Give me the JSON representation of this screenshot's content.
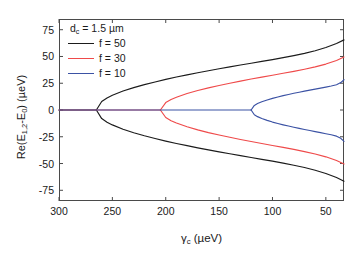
{
  "chart_data": {
    "type": "line",
    "title": "",
    "xlabel": "γ_c (μeV)",
    "ylabel": "Re(E_1,2 - E_0) (μeV)",
    "xlabel_parts": {
      "symbol": "γ",
      "sub": "c",
      "unit": "(μeV)"
    },
    "ylabel_parts": {
      "prefix": "Re(E",
      "sub1": "1,2",
      "mid": "-E",
      "sub2": "0",
      "suffix": ") (μeV)"
    },
    "xlim": [
      300,
      33
    ],
    "ylim": [
      -85,
      85
    ],
    "x_reversed": true,
    "xticks": [
      300,
      250,
      200,
      150,
      100,
      50
    ],
    "yticks": [
      75,
      50,
      25,
      0,
      -25,
      -50,
      -75
    ],
    "xtick_labels": [
      "300",
      "250",
      "200",
      "150",
      "100",
      "50"
    ],
    "ytick_labels": [
      "75",
      "50",
      "25",
      "0",
      "-25",
      "-50",
      "-75"
    ],
    "grid": false,
    "legend_position": "upper-left",
    "annotation": "d_c = 1.5 μm",
    "annotation_parts": {
      "symbol": "d",
      "sub": "c",
      "value": " = 1.5 μm"
    },
    "series": [
      {
        "name": "f = 50",
        "label": "f = 50",
        "color": "#1b1b1b",
        "bifurcation_gamma": 265,
        "branch_max_at_right": 66,
        "branch_min_at_right": -67,
        "flat_segment": {
          "from_gamma": 300,
          "to_gamma": 265,
          "value": 0
        },
        "upper_branch": {
          "x": [
            265,
            260,
            255,
            250,
            240,
            230,
            220,
            210,
            200,
            190,
            180,
            170,
            160,
            150,
            140,
            130,
            120,
            110,
            100,
            90,
            80,
            70,
            60,
            50,
            40,
            33
          ],
          "y": [
            0,
            7.9,
            11.2,
            13.7,
            17.7,
            20.9,
            23.7,
            26.2,
            28.6,
            30.8,
            32.8,
            34.8,
            36.7,
            38.5,
            40.3,
            42.0,
            43.7,
            45.4,
            47.1,
            48.9,
            50.8,
            52.9,
            55.4,
            58.4,
            62.1,
            65.5
          ]
        },
        "lower_branch_sign": -1
      },
      {
        "name": "f = 30",
        "label": "f = 30",
        "color": "#ef4a4a",
        "bifurcation_gamma": 205,
        "branch_max_at_right": 51,
        "branch_min_at_right": -52,
        "flat_segment": {
          "from_gamma": 300,
          "to_gamma": 205,
          "value": 0
        },
        "upper_branch": {
          "x": [
            205,
            200,
            195,
            190,
            180,
            170,
            160,
            150,
            140,
            130,
            120,
            110,
            100,
            90,
            80,
            70,
            60,
            50,
            40,
            33
          ],
          "y": [
            0,
            6.9,
            9.8,
            11.9,
            15.4,
            18.2,
            20.7,
            22.9,
            25.0,
            27.0,
            28.9,
            30.7,
            32.5,
            34.3,
            36.1,
            38.1,
            40.3,
            42.9,
            46.3,
            49.5
          ]
        },
        "lower_branch_sign": -1
      },
      {
        "name": "f = 10",
        "label": "f = 10",
        "color": "#3b52a4",
        "bifurcation_gamma": 120,
        "branch_max_at_right": 29,
        "branch_min_at_right": -30,
        "flat_segment": {
          "from_gamma": 300,
          "to_gamma": 120,
          "value": 0
        },
        "upper_branch": {
          "x": [
            120,
            117,
            114,
            110,
            105,
            100,
            95,
            90,
            85,
            80,
            75,
            70,
            65,
            60,
            55,
            50,
            45,
            40,
            36,
            33
          ],
          "y": [
            0,
            4.3,
            6.0,
            7.7,
            9.4,
            10.9,
            12.2,
            13.4,
            14.5,
            15.6,
            16.6,
            17.6,
            18.5,
            19.5,
            20.4,
            21.4,
            22.4,
            23.6,
            25.6,
            28.3
          ]
        },
        "lower_branch_sign": -1
      }
    ]
  },
  "plot_geometry": {
    "left": 59,
    "top": 19,
    "width": 285,
    "height": 182,
    "frame_color": "#4a4a4a"
  }
}
